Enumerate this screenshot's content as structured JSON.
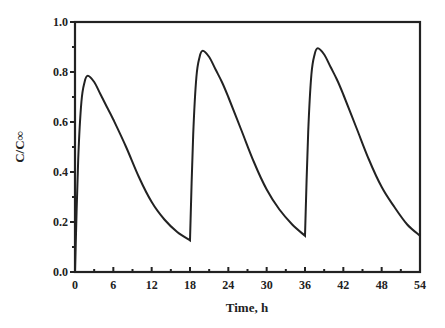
{
  "chart_data": {
    "type": "line",
    "title": "",
    "xlabel": "Time, h",
    "ylabel": "C/C∞",
    "xlim": [
      0,
      54
    ],
    "ylim": [
      0.0,
      1.0
    ],
    "xticks": [
      0,
      6,
      12,
      18,
      24,
      30,
      36,
      42,
      48,
      54
    ],
    "xtick_labels": [
      "0",
      "6",
      "12",
      "18",
      "24",
      "30",
      "36",
      "42",
      "48",
      "54"
    ],
    "yticks": [
      0.0,
      0.2,
      0.4,
      0.6,
      0.8,
      1.0
    ],
    "ytick_labels": [
      "0.0",
      "0.2",
      "0.4",
      "0.6",
      "0.8",
      "1.0"
    ],
    "grid": false,
    "legend": "none",
    "line_color": "#222222",
    "series": [
      {
        "name": "concentration",
        "x": [
          0,
          0.5,
          1,
          1.5,
          2,
          3,
          4,
          5,
          6,
          8,
          10,
          12,
          14,
          16,
          18,
          18.5,
          19,
          19.5,
          20,
          21,
          22,
          23,
          24,
          26,
          28,
          30,
          32,
          34,
          36,
          36.5,
          37,
          37.5,
          38,
          39,
          40,
          41,
          42,
          44,
          46,
          48,
          50,
          52,
          54
        ],
        "y": [
          0.0,
          0.45,
          0.68,
          0.76,
          0.785,
          0.76,
          0.71,
          0.66,
          0.61,
          0.5,
          0.38,
          0.28,
          0.21,
          0.16,
          0.127,
          0.55,
          0.78,
          0.86,
          0.885,
          0.86,
          0.81,
          0.76,
          0.7,
          0.57,
          0.44,
          0.33,
          0.25,
          0.19,
          0.145,
          0.56,
          0.79,
          0.87,
          0.895,
          0.87,
          0.82,
          0.77,
          0.71,
          0.58,
          0.45,
          0.34,
          0.26,
          0.19,
          0.145
        ]
      }
    ]
  }
}
